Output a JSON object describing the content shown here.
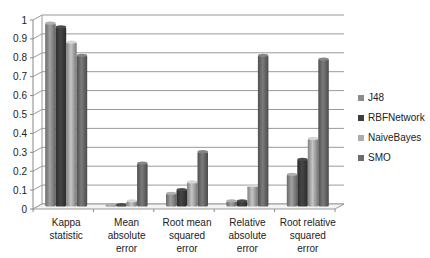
{
  "chart_data": {
    "type": "bar",
    "style": "3d-clustered-column",
    "title": "",
    "xlabel": "",
    "ylabel": "",
    "ylim": [
      0,
      1
    ],
    "yticks": [
      "0",
      "0.1",
      "0.2",
      "0.3",
      "0.4",
      "0.5",
      "0.6",
      "0.7",
      "0.8",
      "0.9",
      "1"
    ],
    "grid": true,
    "legend_position": "right",
    "categories": [
      [
        "Kappa",
        "statistic"
      ],
      [
        "Mean",
        "absolute",
        "error"
      ],
      [
        "Root mean",
        "squared",
        "error"
      ],
      [
        "Relative",
        "absolute",
        "error"
      ],
      [
        "Root relative",
        "squared",
        "error"
      ]
    ],
    "series": [
      {
        "name": "J48",
        "color": "#8c8c8c",
        "values": [
          0.97,
          0.01,
          0.07,
          0.03,
          0.17
        ]
      },
      {
        "name": "RBFNetwork",
        "color": "#3d3d3d",
        "values": [
          0.95,
          0.01,
          0.09,
          0.03,
          0.25
        ]
      },
      {
        "name": "NaiveBayes",
        "color": "#ababab",
        "values": [
          0.87,
          0.03,
          0.13,
          0.11,
          0.36
        ]
      },
      {
        "name": "SMO",
        "color": "#6b6b6b",
        "values": [
          0.8,
          0.23,
          0.29,
          0.8,
          0.78
        ]
      }
    ]
  }
}
